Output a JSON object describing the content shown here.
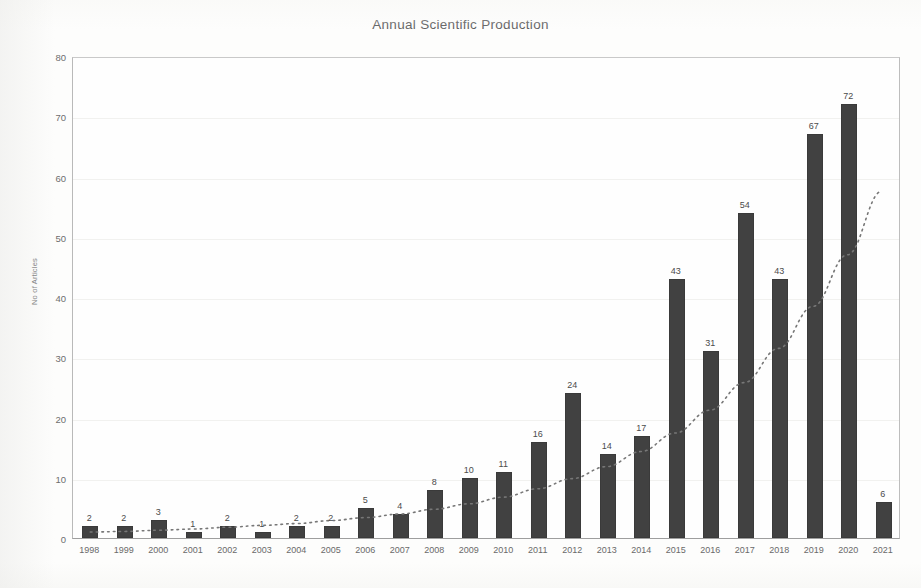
{
  "chart_data": {
    "type": "bar",
    "title": "Annual Scientific Production",
    "xlabel": "",
    "ylabel": "No of Articles",
    "categories": [
      "1998",
      "1999",
      "2000",
      "2001",
      "2002",
      "2003",
      "2004",
      "2005",
      "2006",
      "2007",
      "2008",
      "2009",
      "2010",
      "2011",
      "2012",
      "2013",
      "2014",
      "2015",
      "2016",
      "2017",
      "2018",
      "2019",
      "2020",
      "2021"
    ],
    "values": [
      2,
      2,
      3,
      1,
      2,
      1,
      2,
      2,
      5,
      4,
      8,
      10,
      11,
      16,
      24,
      14,
      17,
      43,
      31,
      54,
      43,
      67,
      72,
      6
    ],
    "ylim": [
      0,
      80
    ],
    "yticks": [
      0,
      10,
      20,
      30,
      40,
      50,
      60,
      70,
      80
    ],
    "grid": true,
    "legend": "none",
    "series": [
      {
        "name": "No of Articles",
        "values": [
          2,
          2,
          3,
          1,
          2,
          1,
          2,
          2,
          5,
          4,
          8,
          10,
          11,
          16,
          24,
          14,
          17,
          43,
          31,
          54,
          43,
          67,
          72,
          6
        ],
        "color": "#414141",
        "render": "bar"
      },
      {
        "name": "Trendline",
        "render": "dotted-line",
        "color": "#777777",
        "description": "exponential-style dotted trend curve rising from about 1 in 1998 to about 60 at the right edge",
        "values": [
          1.0,
          1.1,
          1.3,
          1.5,
          1.8,
          2.1,
          2.4,
          2.9,
          3.4,
          4.0,
          4.8,
          5.7,
          6.8,
          8.2,
          9.9,
          11.9,
          14.4,
          17.5,
          21.3,
          25.9,
          31.6,
          38.6,
          47.2,
          57.8
        ]
      }
    ],
    "bar_color": "#414141",
    "trendline_color": "#777777",
    "background_color": "#fdfdfc"
  }
}
